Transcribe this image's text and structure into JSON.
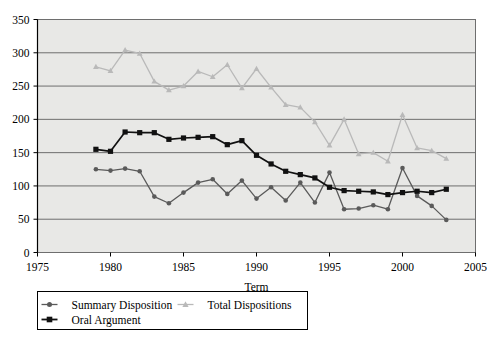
{
  "chart_data": {
    "type": "line",
    "title": "",
    "xlabel": "Term",
    "ylabel": "",
    "xlim": [
      1975,
      2005
    ],
    "ylim": [
      0,
      350
    ],
    "xticks": [
      1975,
      1980,
      1985,
      1990,
      1995,
      2000,
      2005
    ],
    "yticks": [
      0,
      50,
      100,
      150,
      200,
      250,
      300,
      350
    ],
    "grid": "horizontal",
    "legend_position": "below-left",
    "plot_background": "#e8e8e6",
    "x": [
      1979,
      1980,
      1981,
      1982,
      1983,
      1984,
      1985,
      1986,
      1987,
      1988,
      1989,
      1990,
      1991,
      1992,
      1993,
      1994,
      1995,
      1996,
      1997,
      1998,
      1999,
      2000,
      2001,
      2002,
      2003
    ],
    "series": [
      {
        "name": "Summary Disposition",
        "color": "#5a5a5a",
        "marker": "circle",
        "values": [
          125,
          123,
          126,
          122,
          84,
          74,
          90,
          105,
          110,
          88,
          108,
          81,
          98,
          78,
          105,
          75,
          120,
          65,
          66,
          71,
          65,
          127,
          85,
          70,
          49
        ]
      },
      {
        "name": "Total Dispositions",
        "color": "#b9b9b9",
        "marker": "triangle",
        "values": [
          279,
          273,
          304,
          299,
          257,
          244,
          250,
          272,
          264,
          282,
          247,
          276,
          248,
          222,
          218,
          196,
          161,
          200,
          148,
          150,
          137,
          207,
          157,
          153,
          141
        ]
      },
      {
        "name": "Oral Argument",
        "color": "#111111",
        "marker": "square",
        "values": [
          155,
          152,
          181,
          180,
          180,
          170,
          172,
          173,
          174,
          162,
          168,
          146,
          133,
          122,
          117,
          112,
          98,
          93,
          92,
          91,
          87,
          90,
          92,
          90,
          95
        ]
      }
    ],
    "legend": [
      {
        "label": "Summary Disposition",
        "color": "#5a5a5a",
        "marker": "circle"
      },
      {
        "label": "Total Dispositions",
        "color": "#b9b9b9",
        "marker": "triangle"
      },
      {
        "label": "Oral Argument",
        "color": "#111111",
        "marker": "square"
      }
    ]
  }
}
